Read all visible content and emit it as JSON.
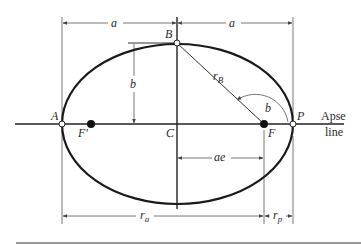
{
  "figure": {
    "type": "elliptical orbit geometry",
    "points": {
      "apoapsis": "A",
      "periapsis": "P",
      "center": "C",
      "minor_axis_point": "B",
      "focus": "F",
      "empty_focus": "F'"
    },
    "dimensions": {
      "semi_major_left": "a",
      "semi_major_right": "a",
      "semi_minor": "b",
      "focal_offset": "ae",
      "apoapsis_radius": "r",
      "apoapsis_radius_sub": "a",
      "periapsis_radius": "r",
      "periapsis_radius_sub": "p",
      "radius_to_B": "r",
      "radius_to_B_sub": "B",
      "angle": "b"
    },
    "axis_label_line1": "Apse",
    "axis_label_line2": "line",
    "colors": {
      "ellipse": "#1a1a1a",
      "dimension_lines": "#555555",
      "rule": "#9a9a9a"
    }
  }
}
